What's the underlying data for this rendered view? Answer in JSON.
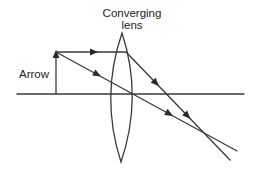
{
  "diagram": {
    "labels": {
      "lens_line1": "Converging",
      "lens_line2": "lens",
      "object": "Arrow"
    },
    "elements": {
      "principal_axis": "horizontal optical axis",
      "object": "upright arrow standing on axis, left of lens",
      "lens": "biconvex converging lens",
      "rays": [
        {
          "name": "parallel-ray",
          "description": "from arrow tip parallel to axis, refracted through focal point"
        },
        {
          "name": "central-ray",
          "description": "from arrow tip straight through lens center, undeviated"
        }
      ],
      "image_point": "rays intersect below axis, right of lens (inverted real image)"
    },
    "colors": {
      "line": "#3a3a3a",
      "text": "#222222",
      "background": "#ffffff"
    }
  }
}
